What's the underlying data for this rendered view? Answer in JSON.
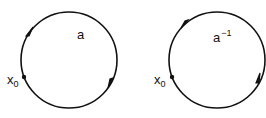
{
  "diagram": {
    "loops": [
      {
        "id": "loop-a",
        "label": "a",
        "label_sup": "",
        "basepoint_label": "x",
        "basepoint_sub": "0",
        "orientation": "clockwise",
        "center": [
          69,
          60
        ],
        "radius": 48
      },
      {
        "id": "loop-a-inverse",
        "label": "a",
        "label_sup": "−1",
        "basepoint_label": "x",
        "basepoint_sub": "0",
        "orientation": "counterclockwise",
        "center": [
          217,
          60
        ],
        "radius": 48
      }
    ],
    "colors": {
      "stroke": "#111111",
      "background": "#ffffff"
    }
  }
}
